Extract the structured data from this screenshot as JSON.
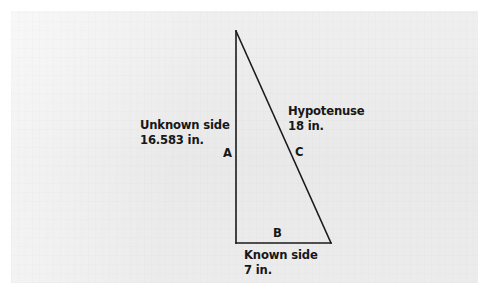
{
  "figure": {
    "background_color": "#ffffff",
    "panel_color": "#ededed",
    "stroke_color": "#1a1a1a",
    "text_color": "#171717"
  },
  "triangle": {
    "vertices": {
      "apex": {
        "x": 236,
        "y": 31
      },
      "bottom_left": {
        "x": 236,
        "y": 243
      },
      "bottom_right": {
        "x": 331,
        "y": 243
      }
    },
    "stroke_width": 1.6
  },
  "labels": {
    "unknown_side": {
      "name": "Unknown side",
      "value": "16.583 in."
    },
    "hypotenuse": {
      "name": "Hypotenuse",
      "value": "18 in."
    },
    "known_side": {
      "name": "Known side",
      "value": "7 in."
    },
    "vertex_a": "A",
    "vertex_b": "B",
    "vertex_c": "C"
  },
  "chart_data": {
    "type": "diagram",
    "shape": "right-triangle",
    "sides": [
      {
        "label": "A",
        "role": "Unknown side",
        "length": 16.583,
        "units": "in.",
        "orientation": "vertical-left"
      },
      {
        "label": "B",
        "role": "Known side",
        "length": 7,
        "units": "in.",
        "orientation": "horizontal-bottom"
      },
      {
        "label": "C",
        "role": "Hypotenuse",
        "length": 18,
        "units": "in.",
        "orientation": "diagonal-right"
      }
    ],
    "right_angle_at": "bottom-left"
  }
}
